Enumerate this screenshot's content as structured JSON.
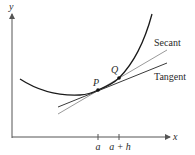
{
  "diagram": {
    "axes": {
      "x_label": "x",
      "y_label": "y"
    },
    "ticks": [
      {
        "label": "a",
        "x": 98
      },
      {
        "label": "a + h",
        "x": 119
      }
    ],
    "points": [
      {
        "label": "P",
        "x": 98,
        "y": 90
      },
      {
        "label": "Q",
        "x": 119,
        "y": 78
      }
    ],
    "lines": {
      "secant_label": "Secant",
      "tangent_label": "Tangent"
    },
    "colors": {
      "curve": "#1a1a1a",
      "tangent": "#3a3a3a",
      "secant": "#9a9a9a",
      "axis": "#555555"
    }
  }
}
